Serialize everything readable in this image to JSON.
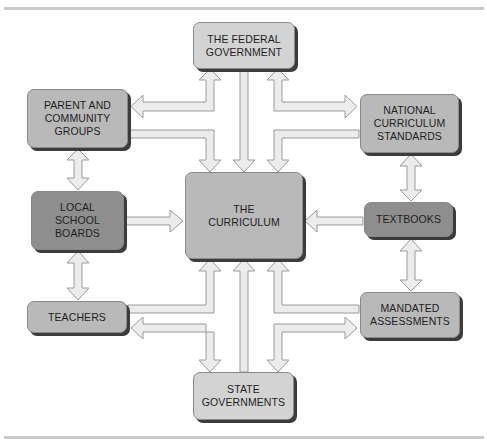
{
  "diagram": {
    "title": "",
    "colors": {
      "light_box": "#d3d3d3",
      "mid_box": "#b9b9b9",
      "dark_box": "#8e8e8e",
      "shadow": "#3c3c3c",
      "arrow_fill": "#ececec",
      "arrow_stroke": "#9a9a9a",
      "rule": "#c9c9c9"
    },
    "nodes": {
      "federal": {
        "label": "THE FEDERAL\nGOVERNMENT"
      },
      "parents": {
        "label": "PARENT AND\nCOMMUNITY\nGROUPS"
      },
      "national_standards": {
        "label": "NATIONAL\nCURRICULUM\nSTANDARDS"
      },
      "local_boards": {
        "label": "LOCAL\nSCHOOL\nBOARDS"
      },
      "curriculum": {
        "label": "THE\nCURRICULUM"
      },
      "textbooks": {
        "label": "TEXTBOOKS"
      },
      "teachers": {
        "label": "TEACHERS"
      },
      "assessments": {
        "label": "MANDATED\nASSESSMENTS"
      },
      "state": {
        "label": "STATE\nGOVERNMENTS"
      }
    },
    "edges": [
      {
        "from": "THE FEDERAL GOVERNMENT",
        "to": "THE CURRICULUM",
        "type": "one-way"
      },
      {
        "from": "STATE GOVERNMENTS",
        "to": "THE CURRICULUM",
        "type": "one-way"
      },
      {
        "from": "PARENT AND COMMUNITY GROUPS",
        "to": "THE CURRICULUM",
        "type": "one-way"
      },
      {
        "from": "NATIONAL CURRICULUM STANDARDS",
        "to": "THE CURRICULUM",
        "type": "one-way"
      },
      {
        "from": "LOCAL SCHOOL BOARDS",
        "to": "THE CURRICULUM",
        "type": "one-way"
      },
      {
        "from": "TEXTBOOKS",
        "to": "THE CURRICULUM",
        "type": "one-way"
      },
      {
        "from": "TEACHERS",
        "to": "THE CURRICULUM",
        "type": "one-way"
      },
      {
        "from": "MANDATED ASSESSMENTS",
        "to": "THE CURRICULUM",
        "type": "one-way"
      },
      {
        "from": "THE FEDERAL GOVERNMENT",
        "to": "PARENT AND COMMUNITY GROUPS",
        "type": "two-way"
      },
      {
        "from": "THE FEDERAL GOVERNMENT",
        "to": "NATIONAL CURRICULUM STANDARDS",
        "type": "two-way"
      },
      {
        "from": "STATE GOVERNMENTS",
        "to": "TEACHERS",
        "type": "two-way"
      },
      {
        "from": "STATE GOVERNMENTS",
        "to": "MANDATED ASSESSMENTS",
        "type": "two-way"
      },
      {
        "from": "PARENT AND COMMUNITY GROUPS",
        "to": "LOCAL SCHOOL BOARDS",
        "type": "two-way"
      },
      {
        "from": "LOCAL SCHOOL BOARDS",
        "to": "TEACHERS",
        "type": "two-way"
      },
      {
        "from": "NATIONAL CURRICULUM STANDARDS",
        "to": "TEXTBOOKS",
        "type": "two-way"
      },
      {
        "from": "TEXTBOOKS",
        "to": "MANDATED ASSESSMENTS",
        "type": "two-way"
      }
    ]
  }
}
